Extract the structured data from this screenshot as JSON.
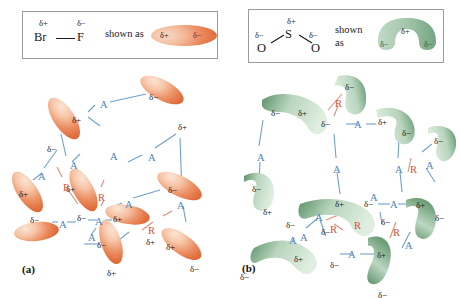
{
  "figure": {
    "caption_a": "(a)",
    "caption_b": "(b)",
    "colors": {
      "attraction_blue": "#4f86bd",
      "repulsion_red": "#d4513c",
      "molecule_a_dark": "#e06c3a",
      "molecule_a_light": "#fbe4d5",
      "molecule_b_dark": "#4e8a61",
      "molecule_b_light": "#e2eee2",
      "box_border": "#9a9a9a"
    },
    "symbols": {
      "delta_plus": "δ+",
      "delta_minus": "δ−",
      "attraction": "A",
      "repulsion": "R"
    }
  },
  "legend_a": {
    "name": "bromine-monofluoride-legend",
    "delta_plus": "δ+",
    "delta_minus": "δ−",
    "atom_left": "Br",
    "atom_right": "F",
    "shown_as": "shown as",
    "model_plus": "δ+",
    "model_minus": "δ−"
  },
  "legend_b": {
    "name": "sulfur-dioxide-legend",
    "delta_plus": "δ+",
    "delta_minus_left": "δ−",
    "delta_minus_right": "δ−",
    "atom_center": "S",
    "atom_left": "O",
    "atom_right": "O",
    "shown_line1": "shown",
    "shown_line2": "as",
    "model_plus": "δ+",
    "model_minus_left": "δ−",
    "model_minus_right": "δ−"
  },
  "panel_a": {
    "label": "(a)",
    "molecules": [
      {
        "id": "a1",
        "plus": "δ+",
        "minus": "δ−"
      },
      {
        "id": "a2",
        "plus": "δ+",
        "minus": "δ−"
      },
      {
        "id": "a3",
        "plus": "δ+",
        "minus": "δ−"
      },
      {
        "id": "a4",
        "plus": "δ+",
        "minus": "δ−"
      },
      {
        "id": "a5",
        "plus": "δ+",
        "minus": "δ−"
      },
      {
        "id": "a6",
        "plus": "δ+",
        "minus": "δ−"
      },
      {
        "id": "a7",
        "plus": "δ+",
        "minus": "δ−"
      },
      {
        "id": "a8",
        "plus": "δ+",
        "minus": "δ−"
      },
      {
        "id": "a9",
        "plus": "δ+",
        "minus": "δ−"
      }
    ],
    "charge_labels": [
      {
        "t": "δ−",
        "x": 149,
        "y": 20
      },
      {
        "t": "δ+",
        "x": 178,
        "y": 50
      },
      {
        "t": "δ+",
        "x": 72,
        "y": 43
      },
      {
        "t": "δ−",
        "x": 47,
        "y": 72
      },
      {
        "t": "δ+",
        "x": 19,
        "y": 117
      },
      {
        "t": "δ−",
        "x": 30,
        "y": 143
      },
      {
        "t": "δ+",
        "x": 66,
        "y": 112
      },
      {
        "t": "δ−",
        "x": 77,
        "y": 141
      },
      {
        "t": "δ+",
        "x": 113,
        "y": 142
      },
      {
        "t": "δ−",
        "x": 168,
        "y": 113
      },
      {
        "t": "δ+",
        "x": 146,
        "y": 165
      },
      {
        "t": "δ−",
        "x": 97,
        "y": 168
      },
      {
        "t": "δ+",
        "x": 107,
        "y": 196
      },
      {
        "t": "δ+",
        "x": 166,
        "y": 170
      },
      {
        "t": "δ−",
        "x": 190,
        "y": 192
      }
    ],
    "interaction_labels": [
      {
        "t": "A",
        "x": 100,
        "y": 27
      },
      {
        "t": "A",
        "x": 110,
        "y": 79
      },
      {
        "t": "A",
        "x": 70,
        "y": 88
      },
      {
        "t": "A",
        "x": 38,
        "y": 99
      },
      {
        "t": "A",
        "x": 148,
        "y": 80
      },
      {
        "t": "R",
        "x": 63,
        "y": 110
      },
      {
        "t": "A",
        "x": 95,
        "y": 144
      },
      {
        "t": "A",
        "x": 59,
        "y": 147
      },
      {
        "t": "R",
        "x": 98,
        "y": 120
      },
      {
        "t": "A",
        "x": 125,
        "y": 127
      },
      {
        "t": "A",
        "x": 177,
        "y": 128
      },
      {
        "t": "A",
        "x": 88,
        "y": 160
      },
      {
        "t": "R",
        "x": 148,
        "y": 153
      }
    ]
  },
  "panel_b": {
    "label": "(b)",
    "molecules": [
      {
        "id": "b1",
        "plus": "δ+",
        "minus_a": "δ−",
        "minus_b": "δ−"
      },
      {
        "id": "b2",
        "plus": "δ+",
        "minus_a": "δ−",
        "minus_b": "δ−"
      },
      {
        "id": "b3",
        "plus": "δ+",
        "minus_a": "δ−",
        "minus_b": "δ−"
      },
      {
        "id": "b4",
        "plus": "δ+",
        "minus_a": "δ−",
        "minus_b": "δ−"
      },
      {
        "id": "b5",
        "plus": "δ+",
        "minus_a": "δ−",
        "minus_b": "δ−"
      },
      {
        "id": "b6",
        "plus": "δ+",
        "minus_a": "δ−",
        "minus_b": "δ−"
      },
      {
        "id": "b7",
        "plus": "δ+",
        "minus_a": "δ−",
        "minus_b": "δ−"
      },
      {
        "id": "b8",
        "plus": "δ+",
        "minus_a": "δ−",
        "minus_b": "δ−"
      }
    ],
    "charge_labels": [
      {
        "t": "δ−",
        "x": 115,
        "y": 10
      },
      {
        "t": "δ−",
        "x": 41,
        "y": 36
      },
      {
        "t": "δ+",
        "x": 68,
        "y": 36
      },
      {
        "t": "δ−",
        "x": 91,
        "y": 47
      },
      {
        "t": "δ+",
        "x": 148,
        "y": 45
      },
      {
        "t": "δ−",
        "x": 172,
        "y": 56
      },
      {
        "t": "δ−",
        "x": 204,
        "y": 64
      },
      {
        "t": "δ−",
        "x": 22,
        "y": 112
      },
      {
        "t": "δ+",
        "x": 33,
        "y": 135
      },
      {
        "t": "δ+",
        "x": 105,
        "y": 127
      },
      {
        "t": "δ−",
        "x": 134,
        "y": 127
      },
      {
        "t": "δ+",
        "x": 186,
        "y": 128
      },
      {
        "t": "δ−",
        "x": 91,
        "y": 155
      },
      {
        "t": "δ−",
        "x": 56,
        "y": 148
      },
      {
        "t": "δ−",
        "x": 151,
        "y": 145
      },
      {
        "t": "δ−",
        "x": 205,
        "y": 141
      },
      {
        "t": "δ+",
        "x": 64,
        "y": 182
      },
      {
        "t": "δ−",
        "x": 100,
        "y": 188
      },
      {
        "t": "δ−",
        "x": 10,
        "y": 200
      },
      {
        "t": "δ+",
        "x": 147,
        "y": 178
      },
      {
        "t": "δ−",
        "x": 148,
        "y": 218
      }
    ],
    "interaction_labels": [
      {
        "t": "R",
        "x": 105,
        "y": 26
      },
      {
        "t": "A",
        "x": 124,
        "y": 47
      },
      {
        "t": "A",
        "x": 27,
        "y": 80
      },
      {
        "t": "A",
        "x": 103,
        "y": 92
      },
      {
        "t": "A",
        "x": 165,
        "y": 92
      },
      {
        "t": "R",
        "x": 180,
        "y": 92
      },
      {
        "t": "A",
        "x": 196,
        "y": 88
      },
      {
        "t": "A",
        "x": 160,
        "y": 127
      },
      {
        "t": "R",
        "x": 100,
        "y": 152
      },
      {
        "t": "A",
        "x": 70,
        "y": 160
      },
      {
        "t": "A",
        "x": 140,
        "y": 120
      },
      {
        "t": "R",
        "x": 163,
        "y": 155
      },
      {
        "t": "A",
        "x": 118,
        "y": 177
      },
      {
        "t": "A",
        "x": 59,
        "y": 163
      },
      {
        "t": "A",
        "x": 85,
        "y": 140
      },
      {
        "t": "R",
        "x": 124,
        "y": 148
      },
      {
        "t": "A",
        "x": 175,
        "y": 168
      }
    ]
  }
}
